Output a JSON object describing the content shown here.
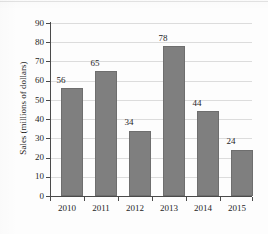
{
  "chart_data": {
    "type": "bar",
    "title": "",
    "xlabel": "",
    "ylabel": "Sales (millions of dollars)",
    "categories": [
      "2010",
      "2011",
      "2012",
      "2013",
      "2014",
      "2015"
    ],
    "values": [
      56,
      65,
      34,
      78,
      44,
      24
    ],
    "value_labels": [
      "56",
      "65",
      "34",
      "78",
      "44",
      "24"
    ],
    "ylim": [
      0,
      90
    ],
    "ytick_step": 10,
    "yticks": [
      "0",
      "10",
      "20",
      "30",
      "40",
      "50",
      "60",
      "70",
      "80",
      "90"
    ],
    "grid": true,
    "legend": false,
    "legend_position": "none",
    "bar_color": "#7f7f7f",
    "bar_edge_color": "#6e6e6e",
    "gridline_color": "#dcdcdc",
    "axis_color": "#4a4a4a",
    "background_color": "#fdfdfd"
  }
}
